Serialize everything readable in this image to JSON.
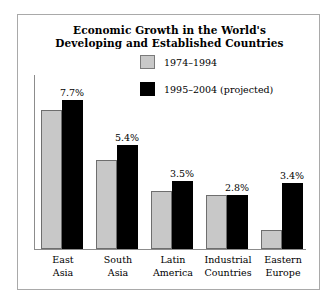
{
  "chart_data": {
    "type": "bar",
    "title": "Economic Growth in the World's Developing and Established Countries",
    "title_lines": [
      "Economic Growth in the World's",
      "Developing and Established Countries"
    ],
    "xlabel": "",
    "ylabel": "",
    "ylim": [
      0,
      9
    ],
    "grid": false,
    "legend_position": "top-right",
    "categories": [
      "East Asia",
      "South Asia",
      "Latin America",
      "Industrial Countries",
      "Eastern Europe"
    ],
    "category_lines": [
      [
        "East",
        "Asia"
      ],
      [
        "South",
        "Asia"
      ],
      [
        "Latin",
        "America"
      ],
      [
        "Industrial",
        "Countries"
      ],
      [
        "Eastern",
        "Europe"
      ]
    ],
    "series": [
      {
        "name": "1974–1994",
        "color": "#c8c8c8",
        "values": [
          7.2,
          4.6,
          3.0,
          2.8,
          1.0
        ]
      },
      {
        "name": "1995–2004 (projected)",
        "color": "#000000",
        "values": [
          7.7,
          5.4,
          3.5,
          2.8,
          3.4
        ]
      }
    ],
    "data_labels": [
      "7.7%",
      "5.4%",
      "3.5%",
      "2.8%",
      "3.4%"
    ],
    "data_label_series": "1995–2004 (projected)"
  },
  "legend": {
    "items": [
      {
        "label": "1974–1994",
        "color": "#c8c8c8"
      },
      {
        "label": "1995–2004 (projected)",
        "color": "#000000"
      }
    ]
  },
  "colors": {
    "frame": "#a9a9a9",
    "axis": "#8c8c8c",
    "bar_gray": "#c8c8c8",
    "bar_black": "#000000",
    "text": "#000000",
    "background": "#ffffff"
  }
}
